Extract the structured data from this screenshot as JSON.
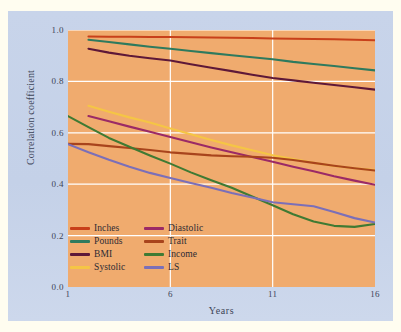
{
  "chart_data": {
    "type": "line",
    "title": "",
    "xlabel": "Years",
    "ylabel": "Correlation coefficient",
    "xlim": [
      1,
      16
    ],
    "ylim": [
      0.0,
      1.0
    ],
    "xticks": [
      1,
      6,
      11,
      16
    ],
    "xtick_labels": [
      "1",
      "6",
      "11",
      "16"
    ],
    "yticks": [
      0.0,
      0.2,
      0.4,
      0.6,
      0.8,
      1.0
    ],
    "ytick_labels": [
      "0.0",
      "0.2",
      "0.4",
      "0.6",
      "0.8",
      "1.0"
    ],
    "grid": true,
    "grid_color": "#ffffff",
    "plot_background": "#f0ab6e",
    "figure_background": "#c4d1e8",
    "legend_position": "lower left",
    "legend_columns": 2,
    "series": [
      {
        "name": "Inches",
        "color": "#c8401a",
        "x": [
          2,
          3,
          4,
          5,
          6,
          7,
          8,
          9,
          10,
          11,
          12,
          13,
          14,
          15,
          16
        ],
        "values": [
          0.975,
          0.974,
          0.974,
          0.973,
          0.973,
          0.972,
          0.971,
          0.97,
          0.969,
          0.967,
          0.966,
          0.965,
          0.964,
          0.962,
          0.96
        ]
      },
      {
        "name": "Pounds",
        "color": "#2e7a5e",
        "x": [
          2,
          3,
          4,
          5,
          6,
          7,
          8,
          9,
          10,
          11,
          12,
          13,
          14,
          15,
          16
        ],
        "values": [
          0.962,
          0.953,
          0.944,
          0.935,
          0.927,
          0.918,
          0.91,
          0.902,
          0.894,
          0.886,
          0.876,
          0.868,
          0.86,
          0.851,
          0.843
        ]
      },
      {
        "name": "BMI",
        "color": "#5e1838",
        "x": [
          2,
          3,
          4,
          5,
          6,
          7,
          8,
          9,
          10,
          11,
          12,
          13,
          14,
          15,
          16
        ],
        "values": [
          0.927,
          0.912,
          0.9,
          0.89,
          0.881,
          0.867,
          0.853,
          0.84,
          0.826,
          0.813,
          0.804,
          0.795,
          0.786,
          0.777,
          0.768
        ]
      },
      {
        "name": "Systolic",
        "color": "#f5c545",
        "x": [
          2,
          3,
          4,
          5,
          6,
          7,
          8,
          9,
          10,
          11,
          12,
          13,
          14,
          15,
          16
        ],
        "values": [
          0.705,
          0.682,
          0.66,
          0.64,
          0.617,
          0.594,
          0.572,
          0.551,
          0.532,
          0.513,
          0.498,
          0.483,
          0.471,
          0.462,
          0.455
        ]
      },
      {
        "name": "Diastolic",
        "color": "#9b2a66",
        "x": [
          2,
          3,
          4,
          5,
          6,
          7,
          8,
          9,
          10,
          11,
          12,
          13,
          14,
          15,
          16
        ],
        "values": [
          0.665,
          0.645,
          0.624,
          0.604,
          0.584,
          0.563,
          0.543,
          0.524,
          0.506,
          0.487,
          0.468,
          0.45,
          0.431,
          0.414,
          0.398
        ]
      },
      {
        "name": "Trait",
        "color": "#a8441c",
        "x": [
          1,
          2,
          3,
          4,
          5,
          6,
          7,
          8,
          9,
          10,
          11,
          12,
          13,
          14,
          15,
          16
        ],
        "values": [
          0.557,
          0.556,
          0.548,
          0.541,
          0.533,
          0.524,
          0.518,
          0.512,
          0.509,
          0.507,
          0.503,
          0.494,
          0.483,
          0.472,
          0.462,
          0.453
        ]
      },
      {
        "name": "Income",
        "color": "#3f7a33",
        "x": [
          1,
          2,
          3,
          4,
          5,
          6,
          7,
          8,
          9,
          10,
          11,
          12,
          13,
          14,
          15,
          16
        ],
        "values": [
          0.665,
          0.622,
          0.58,
          0.546,
          0.512,
          0.48,
          0.446,
          0.415,
          0.386,
          0.352,
          0.318,
          0.283,
          0.255,
          0.238,
          0.234,
          0.245
        ]
      },
      {
        "name": "LS",
        "color": "#7b6fb8",
        "x": [
          1,
          2,
          3,
          4,
          5,
          6,
          7,
          8,
          9,
          10,
          11,
          12,
          13,
          14,
          15,
          16
        ],
        "values": [
          0.556,
          0.524,
          0.495,
          0.468,
          0.444,
          0.424,
          0.405,
          0.386,
          0.366,
          0.348,
          0.33,
          0.322,
          0.314,
          0.292,
          0.268,
          0.251
        ]
      }
    ]
  },
  "legend": {
    "entries": [
      {
        "label": "Inches",
        "color": "#c8401a"
      },
      {
        "label": "Diastolic",
        "color": "#9b2a66"
      },
      {
        "label": "Pounds",
        "color": "#2e7a5e"
      },
      {
        "label": "Trait",
        "color": "#a8441c"
      },
      {
        "label": "BMI",
        "color": "#5e1838"
      },
      {
        "label": "Income",
        "color": "#3f7a33"
      },
      {
        "label": "Systolic",
        "color": "#f5c545"
      },
      {
        "label": "LS",
        "color": "#7b6fb8"
      }
    ]
  },
  "axes": {
    "y_title": "Correlation coefficient",
    "x_title": "Years"
  }
}
